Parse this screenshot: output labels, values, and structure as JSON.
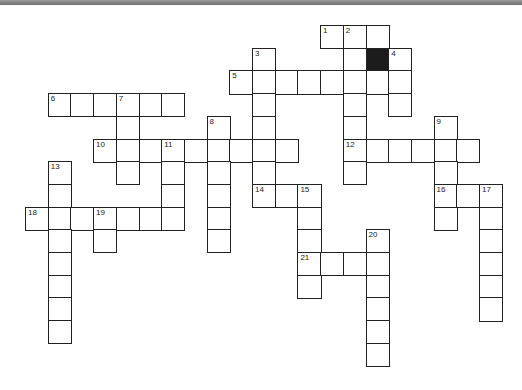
{
  "puzzle": {
    "type": "crossword",
    "cell_size": 22.7,
    "origin": [
      25,
      25
    ],
    "cells": [
      [
        13,
        0,
        "1"
      ],
      [
        14,
        0,
        "2"
      ],
      [
        15,
        0,
        ""
      ],
      [
        10,
        1,
        "3"
      ],
      [
        14,
        1,
        ""
      ],
      [
        15,
        1,
        "",
        "black"
      ],
      [
        16,
        1,
        "4"
      ],
      [
        9,
        2,
        "5"
      ],
      [
        10,
        2,
        ""
      ],
      [
        11,
        2,
        ""
      ],
      [
        12,
        2,
        ""
      ],
      [
        13,
        2,
        ""
      ],
      [
        14,
        2,
        ""
      ],
      [
        15,
        2,
        ""
      ],
      [
        16,
        2,
        ""
      ],
      [
        1,
        3,
        "6"
      ],
      [
        2,
        3,
        ""
      ],
      [
        3,
        3,
        ""
      ],
      [
        4,
        3,
        "7"
      ],
      [
        5,
        3,
        ""
      ],
      [
        6,
        3,
        ""
      ],
      [
        10,
        3,
        ""
      ],
      [
        14,
        3,
        ""
      ],
      [
        16,
        3,
        ""
      ],
      [
        4,
        4,
        ""
      ],
      [
        8,
        4,
        "8"
      ],
      [
        10,
        4,
        ""
      ],
      [
        14,
        4,
        ""
      ],
      [
        18,
        4,
        "9"
      ],
      [
        3,
        5,
        "10"
      ],
      [
        4,
        5,
        ""
      ],
      [
        5,
        5,
        ""
      ],
      [
        6,
        5,
        "11"
      ],
      [
        7,
        5,
        ""
      ],
      [
        8,
        5,
        ""
      ],
      [
        9,
        5,
        ""
      ],
      [
        10,
        5,
        ""
      ],
      [
        11,
        5,
        ""
      ],
      [
        14,
        5,
        "12"
      ],
      [
        15,
        5,
        ""
      ],
      [
        16,
        5,
        ""
      ],
      [
        17,
        5,
        ""
      ],
      [
        18,
        5,
        ""
      ],
      [
        19,
        5,
        ""
      ],
      [
        4,
        6,
        ""
      ],
      [
        6,
        6,
        ""
      ],
      [
        8,
        6,
        ""
      ],
      [
        10,
        6,
        ""
      ],
      [
        14,
        6,
        ""
      ],
      [
        18,
        6,
        ""
      ],
      [
        1,
        6,
        "13"
      ],
      [
        1,
        7,
        ""
      ],
      [
        6,
        7,
        ""
      ],
      [
        8,
        7,
        ""
      ],
      [
        10,
        7,
        "14"
      ],
      [
        11,
        7,
        ""
      ],
      [
        12,
        7,
        "15"
      ],
      [
        18,
        7,
        "16"
      ],
      [
        19,
        7,
        ""
      ],
      [
        20,
        7,
        "17"
      ],
      [
        0,
        8,
        "18"
      ],
      [
        1,
        8,
        ""
      ],
      [
        2,
        8,
        ""
      ],
      [
        3,
        8,
        "19"
      ],
      [
        4,
        8,
        ""
      ],
      [
        5,
        8,
        ""
      ],
      [
        6,
        8,
        ""
      ],
      [
        8,
        8,
        ""
      ],
      [
        12,
        8,
        ""
      ],
      [
        18,
        8,
        ""
      ],
      [
        20,
        8,
        ""
      ],
      [
        1,
        9,
        ""
      ],
      [
        3,
        9,
        ""
      ],
      [
        8,
        9,
        ""
      ],
      [
        12,
        9,
        ""
      ],
      [
        15,
        9,
        "20"
      ],
      [
        20,
        9,
        ""
      ],
      [
        1,
        10,
        ""
      ],
      [
        12,
        10,
        "21"
      ],
      [
        13,
        10,
        ""
      ],
      [
        14,
        10,
        ""
      ],
      [
        15,
        10,
        ""
      ],
      [
        20,
        10,
        ""
      ],
      [
        1,
        11,
        ""
      ],
      [
        12,
        11,
        ""
      ],
      [
        15,
        11,
        ""
      ],
      [
        20,
        11,
        ""
      ],
      [
        1,
        12,
        ""
      ],
      [
        15,
        12,
        ""
      ],
      [
        20,
        12,
        ""
      ],
      [
        1,
        13,
        ""
      ],
      [
        15,
        13,
        ""
      ],
      [
        15,
        14,
        ""
      ]
    ]
  }
}
